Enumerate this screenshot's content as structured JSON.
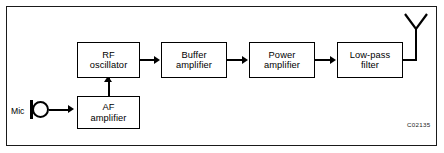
{
  "figure": {
    "caption_code": "C02135",
    "colors": {
      "line": "#000000",
      "frame": "#1a1a1a",
      "background": "#ffffff"
    }
  },
  "blocks": [
    {
      "id": "rf-oscillator",
      "line1": "RF",
      "line2": "oscillator"
    },
    {
      "id": "buffer-amplifier",
      "line1": "Buffer",
      "line2": "amplifier"
    },
    {
      "id": "power-amplifier",
      "line1": "Power",
      "line2": "amplifier"
    },
    {
      "id": "low-pass-filter",
      "line1": "Low-pass",
      "line2": "filter"
    },
    {
      "id": "af-amplifier",
      "line1": "AF",
      "line2": "amplifier"
    }
  ],
  "symbols": {
    "mic_label": "Mic",
    "mic_icon": "microphone-icon",
    "antenna_icon": "antenna-icon"
  },
  "diagram_data": {
    "type": "block-diagram",
    "title": "Radio transmitter block diagram",
    "nodes": [
      "RF oscillator",
      "Buffer amplifier",
      "Power amplifier",
      "Low-pass filter",
      "AF amplifier",
      "Mic",
      "Antenna"
    ],
    "edges": [
      {
        "from": "Mic",
        "to": "AF amplifier",
        "direction": "right"
      },
      {
        "from": "AF amplifier",
        "to": "RF oscillator",
        "direction": "up"
      },
      {
        "from": "RF oscillator",
        "to": "Buffer amplifier",
        "direction": "right"
      },
      {
        "from": "Buffer amplifier",
        "to": "Power amplifier",
        "direction": "right"
      },
      {
        "from": "Power amplifier",
        "to": "Low-pass filter",
        "direction": "right"
      },
      {
        "from": "Low-pass filter",
        "to": "Antenna",
        "direction": "right"
      }
    ]
  }
}
